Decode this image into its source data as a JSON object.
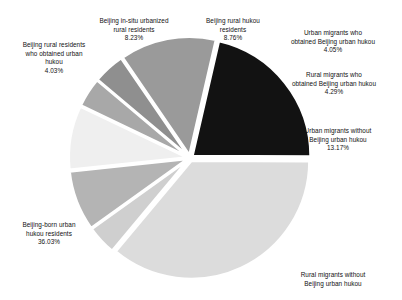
{
  "chart_data": {
    "type": "pie",
    "title": "",
    "xlabel": "",
    "ylabel": "",
    "legend_position": "callout-labels",
    "grid": false,
    "units": "percent",
    "total": 100.03,
    "categories": [
      "Beijing rural hukou residents",
      "Urban migrants who obtained Beijing urban hukou",
      "Rural migrants who obtained Beijing urban hukou",
      "Urban migrants without Beijing urban hukou",
      "Rural migrants without Beijing urban hukou",
      "Beijing-born urban hukou residents",
      "Beijing rural residents who obtained urban hukou",
      "Beijing in-situ urbanized rural residents"
    ],
    "values": [
      8.76,
      4.05,
      4.29,
      13.17,
      21.44,
      36.03,
      4.03,
      8.23
    ],
    "colors": [
      "#efefef",
      "#a8a8a8",
      "#8f8f8f",
      "#9a9a9a",
      "#121212",
      "#dcdcdc",
      "#cfcfcf",
      "#b4b4b4"
    ],
    "slices": [
      {
        "label": "Beijing rural hukou\nresidents",
        "percent_text": "8.76%",
        "value": 8.76,
        "color": "#efefef"
      },
      {
        "label": "Urban migrants who\nobtained Beijing urban hukou",
        "percent_text": "4.05%",
        "value": 4.05,
        "color": "#a8a8a8"
      },
      {
        "label": "Rural migrants who\nobtained Beijing urban hukou",
        "percent_text": "4.29%",
        "value": 4.29,
        "color": "#8f8f8f"
      },
      {
        "label": "Urban migrants without\nBeijing urban hukou",
        "percent_text": "13.17%",
        "value": 13.17,
        "color": "#9a9a9a"
      },
      {
        "label": "Rural migrants without\nBeijing urban hukou",
        "percent_text": "",
        "value": 21.44,
        "color": "#121212"
      },
      {
        "label": "Beijing-born urban\nhukou residents",
        "percent_text": "36.03%",
        "value": 36.03,
        "color": "#dcdcdc"
      },
      {
        "label": "Beijing rural residents\nwho obtained urban\nhukou",
        "percent_text": "4.03%",
        "value": 4.03,
        "color": "#cfcfcf"
      },
      {
        "label": "Beijing in-situ urbanized\nrural residents",
        "percent_text": "8.23%",
        "value": 8.23,
        "color": "#b4b4b4"
      }
    ]
  }
}
